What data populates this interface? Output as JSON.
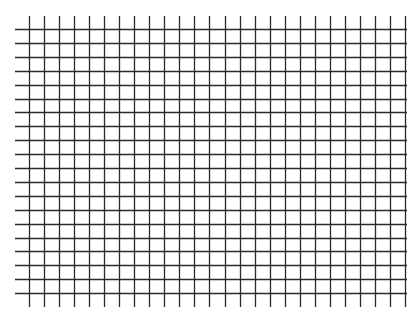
{
  "grid": {
    "description": "Square grid paper",
    "line_color": "#2a2a2a",
    "background": "#ffffff",
    "vertical_lines": {
      "count": 26,
      "x_start": 29,
      "spacing": 15.04,
      "y_top": 16,
      "y_bottom": 307
    },
    "horizontal_lines": {
      "count": 20,
      "y_start": 29,
      "spacing": 13.9,
      "x_left": 15,
      "x_right": 407
    }
  }
}
